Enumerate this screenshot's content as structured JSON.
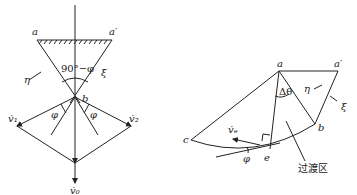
{
  "figure_left": {
    "labels": {
      "a": "a",
      "a_prime": "a′",
      "b": "b",
      "eta": "η",
      "xi": "ξ",
      "angle": "90°−φ",
      "phi_left": "φ",
      "phi_right": "φ",
      "v1": "v̇₁",
      "v2": "v̇₂",
      "v0": "v̇₀"
    }
  },
  "figure_right": {
    "labels": {
      "a": "a",
      "a_prime": "a′",
      "b": "b",
      "c": "c",
      "e": "e",
      "eta": "η",
      "xi": "ξ",
      "delta_theta": "Δθ",
      "phi": "φ",
      "ve": "v̇ₑ",
      "transition_zone": "过渡区"
    }
  },
  "colors": {
    "stroke": "#222222",
    "background": "#ffffff"
  }
}
